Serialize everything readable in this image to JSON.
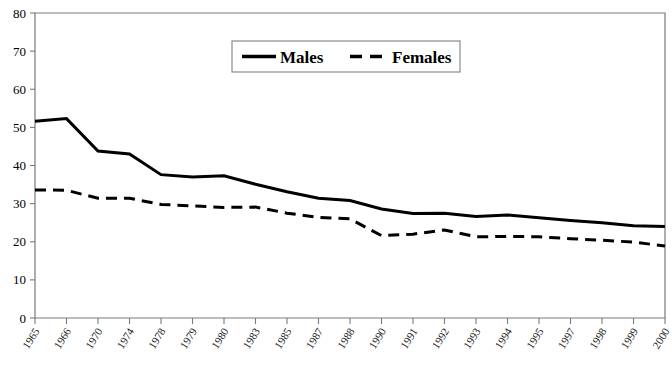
{
  "chart_data": {
    "type": "line",
    "title": "",
    "subtitle": "",
    "xlabel": "",
    "ylabel": "",
    "ylim": [
      0,
      80
    ],
    "ytick_labels": [
      "0",
      "10",
      "20",
      "30",
      "40",
      "50",
      "60",
      "70",
      "80"
    ],
    "ytick_values": [
      0,
      10,
      20,
      30,
      40,
      50,
      60,
      70,
      80
    ],
    "grid": false,
    "legend_position": "top-center",
    "categories": [
      "1965",
      "1966",
      "1970",
      "1974",
      "1978",
      "1979",
      "1980",
      "1983",
      "1985",
      "1987",
      "1988",
      "1990",
      "1991",
      "1992",
      "1993",
      "1994",
      "1995",
      "1997",
      "1998",
      "1999",
      "2000"
    ],
    "series": [
      {
        "name": "Males",
        "style": "solid",
        "color": "#000000",
        "values": [
          51.6,
          52.3,
          43.8,
          43.0,
          37.6,
          37.0,
          37.3,
          35.1,
          33.1,
          31.4,
          30.8,
          28.6,
          27.4,
          27.5,
          26.6,
          27.0,
          26.3,
          25.6,
          25.0,
          24.2,
          24.0
        ]
      },
      {
        "name": "Females",
        "style": "dashed",
        "color": "#000000",
        "values": [
          33.6,
          33.5,
          31.4,
          31.4,
          29.8,
          29.4,
          29.0,
          29.1,
          27.5,
          26.4,
          26.0,
          21.6,
          22.0,
          23.1,
          21.3,
          21.4,
          21.3,
          20.8,
          20.4,
          19.9,
          18.9
        ]
      }
    ],
    "legend": [
      {
        "label": "Males",
        "style": "solid"
      },
      {
        "label": "Females",
        "style": "dashed"
      }
    ]
  }
}
